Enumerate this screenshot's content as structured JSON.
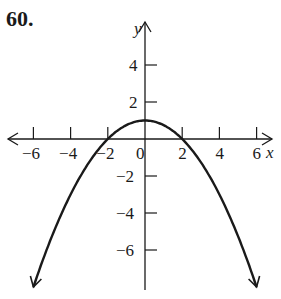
{
  "problem_number": "60.",
  "chart_data": {
    "type": "line",
    "title": "",
    "xlabel": "x",
    "ylabel": "y",
    "xlim": [
      -6.5,
      6.5
    ],
    "ylim": [
      -8,
      5.5
    ],
    "grid": false,
    "x_ticks": [
      -6,
      -4,
      -2,
      2,
      4,
      6
    ],
    "x_tick_labels": [
      "−6",
      "−4",
      "−2",
      "2",
      "4",
      "6"
    ],
    "y_ticks": [
      4,
      2,
      -2,
      -4,
      -6
    ],
    "y_tick_labels": [
      "4",
      "2",
      "−2",
      "−4",
      "−6"
    ],
    "origin_label": "0",
    "series": [
      {
        "name": "parabola",
        "equation": "y = 1 - x^2/4",
        "vertex": [
          0,
          1
        ],
        "x_intercepts": [
          -2,
          2
        ],
        "x": [
          -6,
          -5,
          -4,
          -3,
          -2,
          -1,
          0,
          1,
          2,
          3,
          4,
          5,
          6
        ],
        "values": [
          -8,
          -5.25,
          -3,
          -1.25,
          0,
          0.75,
          1,
          0.75,
          0,
          -1.25,
          -3,
          -5.25,
          -8
        ],
        "arrows_at_ends": true
      }
    ]
  }
}
